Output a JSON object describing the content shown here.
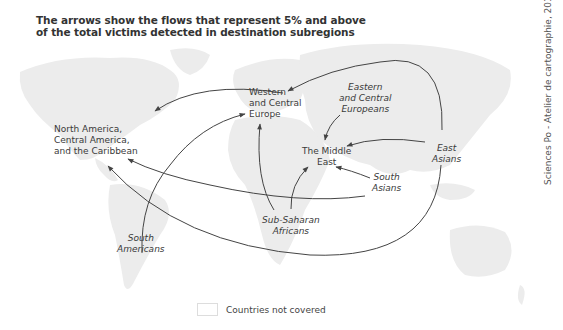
{
  "title": {
    "line1": "The arrows show the flows that represent 5% and above",
    "line2": "of the total victims detected in destination subregions"
  },
  "credit": "Sciences Po - Atelier de cartographie, 2014",
  "destinations": {
    "north_america": [
      "North America,",
      "Central America,",
      "and the Caribbean"
    ],
    "western_europe": [
      "Western",
      "and Central",
      "Europe"
    ],
    "middle_east": [
      "The Middle",
      "East"
    ]
  },
  "origins": {
    "eastern_europeans": [
      "Eastern",
      "and Central",
      "Europeans"
    ],
    "east_asians": [
      "East",
      "Asians"
    ],
    "south_asians": [
      "South",
      "Asians"
    ],
    "sub_saharan": [
      "Sub-Saharan",
      "Africans"
    ],
    "south_americans": [
      "South",
      "Americans"
    ]
  },
  "flows": [
    {
      "from": "Western and Central Europe",
      "to": "North America, Central America, and the Caribbean"
    },
    {
      "from": "East Asians",
      "to": "Western and Central Europe"
    },
    {
      "from": "East Asians",
      "to": "The Middle East"
    },
    {
      "from": "East Asians",
      "to": "North America, Central America, and the Caribbean"
    },
    {
      "from": "Eastern and Central Europeans",
      "to": "The Middle East"
    },
    {
      "from": "South Asians",
      "to": "The Middle East"
    },
    {
      "from": "South Asians",
      "to": "North America, Central America, and the Caribbean"
    },
    {
      "from": "Sub-Saharan Africans",
      "to": "Western and Central Europe"
    },
    {
      "from": "Sub-Saharan Africans",
      "to": "The Middle East"
    },
    {
      "from": "South Americans",
      "to": "Western and Central Europe"
    }
  ],
  "legend": {
    "label": "Countries not covered",
    "swatch_color": "#ffffff"
  },
  "colors": {
    "land": "#ececec",
    "arrow": "#444444",
    "text": "#3a3a3a"
  }
}
